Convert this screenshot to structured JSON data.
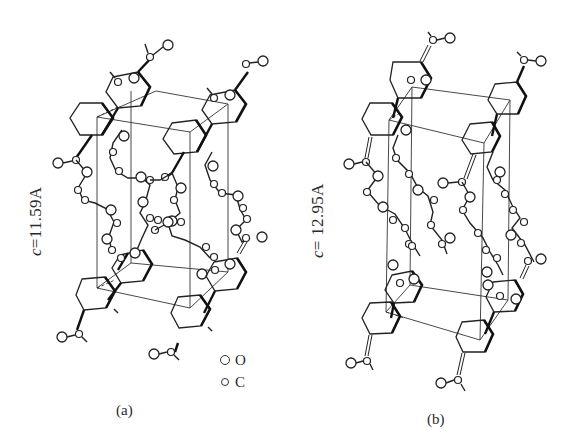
{
  "figure": {
    "panels": [
      {
        "id": "a",
        "label": "(a)",
        "axis_symbol": "c",
        "axis_value": "=11.59A",
        "axis_full": "c=11.59A"
      },
      {
        "id": "b",
        "label": "(b)",
        "axis_symbol": "c",
        "axis_value": "= 12.95A",
        "axis_full": "c= 12.95A"
      }
    ],
    "legend": {
      "items": [
        {
          "symbol": "large-open-circle",
          "label": "O"
        },
        {
          "symbol": "small-open-circle",
          "label": "C"
        }
      ]
    },
    "colors": {
      "line": "#222222",
      "background": "#ffffff"
    }
  }
}
